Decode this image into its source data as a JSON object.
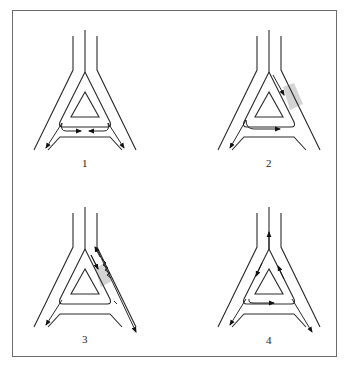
{
  "figure": {
    "panels": [
      {
        "id": 1,
        "label": "1",
        "dx": 0,
        "dy": 0,
        "description": "Two opposing flows meeting on the crossbar, traffic diverging down both outer branches"
      },
      {
        "id": 2,
        "label": "2",
        "dx": 184,
        "dy": 0,
        "description": "Obstruction (shaded) on right branch; flow diverted down inner channel, along crossbar, and out left branch"
      },
      {
        "id": 3,
        "label": "3",
        "dx": 0,
        "dy": 177,
        "description": "Shaded obstruction with zigzag on right branch; bidirectional flow in right channel, exit down right outer branch"
      },
      {
        "id": 4,
        "label": "4",
        "dx": 184,
        "dy": 177,
        "description": "Circulating flow around the triangle with exit up the stem and down both outer branches"
      }
    ],
    "colors": {
      "line": "#2a2a2a",
      "shade": "#d4d4d4",
      "frame": "#6b6b6b"
    }
  }
}
